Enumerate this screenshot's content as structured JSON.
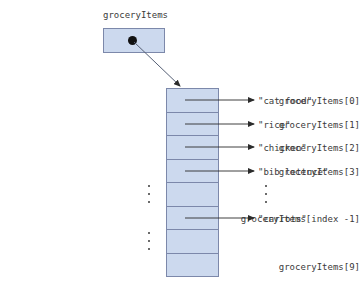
{
  "diagram": {
    "title_variable": "groceryItems",
    "pointer": {
      "label": "groceryItems",
      "icon": "pointer-dot-icon",
      "box_fill": "#ccd9ee",
      "box_border": "#7c88aa"
    },
    "array": {
      "fill": "#ccd9ee",
      "border": "#7c88aa",
      "cell_count": 8
    },
    "rows": [
      {
        "index_label": "groceryItems[0]",
        "value": "\"cat food\"",
        "has_arrow": true
      },
      {
        "index_label": "groceryItems[1]",
        "value": "\"rice\"",
        "has_arrow": true
      },
      {
        "index_label": "groceryItems[2]",
        "value": "\"chicken\"",
        "has_arrow": true
      },
      {
        "index_label": "groceryItems[3]",
        "value": "\"bib lettuce\"",
        "has_arrow": true
      },
      {
        "index_label": "",
        "value": "",
        "has_arrow": false
      },
      {
        "index_label": "groceryItems[index -1]",
        "value": "\"carrots\"",
        "has_arrow": true
      },
      {
        "index_label": "",
        "value": "",
        "has_arrow": false
      },
      {
        "index_label": "groceryItems[9]",
        "value": "",
        "has_arrow": false
      }
    ],
    "ellipses": [
      {
        "name": "left-ellipsis-upper"
      },
      {
        "name": "left-ellipsis-lower"
      },
      {
        "name": "right-ellipsis"
      }
    ],
    "colors": {
      "box_fill": "#ccd9ee",
      "box_border": "#7c88aa",
      "text": "#3a3a3a",
      "arrow": "#2b2b2b",
      "background": "#ffffff"
    }
  }
}
